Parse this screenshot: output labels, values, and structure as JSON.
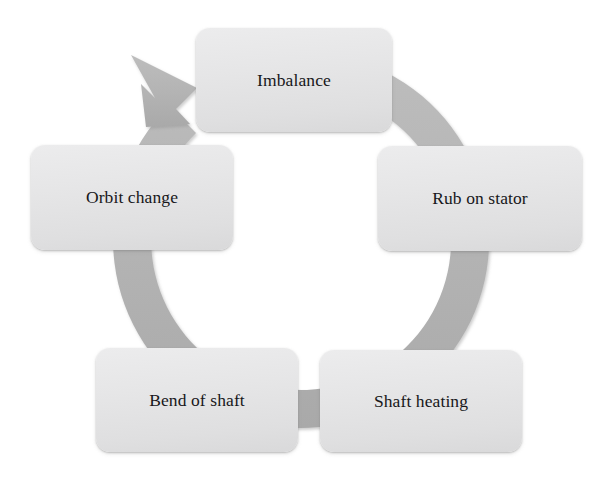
{
  "diagram": {
    "type": "cycle",
    "direction": "clockwise",
    "arrow_count": 1,
    "colors": {
      "background": "#ffffff",
      "ring": "#b4b4b4",
      "ring_shadow": "#9a9a9a",
      "box_fill_top": "#ececed",
      "box_fill_bottom": "#d9d9da",
      "box_shadow": "#9b9b9b",
      "text": "#17171a"
    },
    "nodes": [
      {
        "id": "imbalance",
        "label": "Imbalance",
        "position": "top",
        "order": 1
      },
      {
        "id": "rub-on-stator",
        "label": "Rub on stator",
        "position": "right",
        "order": 2
      },
      {
        "id": "shaft-heating",
        "label": "Shaft heating",
        "position": "bottom-right",
        "order": 3
      },
      {
        "id": "bend-of-shaft",
        "label": "Bend of shaft",
        "position": "bottom-left",
        "order": 4
      },
      {
        "id": "orbit-change",
        "label": "Orbit change",
        "position": "left",
        "order": 5
      }
    ],
    "ring": {
      "center_x": 303,
      "center_y": 240,
      "outer_radius": 188,
      "inner_radius": 150,
      "arrowhead_angle_deg": 225
    }
  }
}
